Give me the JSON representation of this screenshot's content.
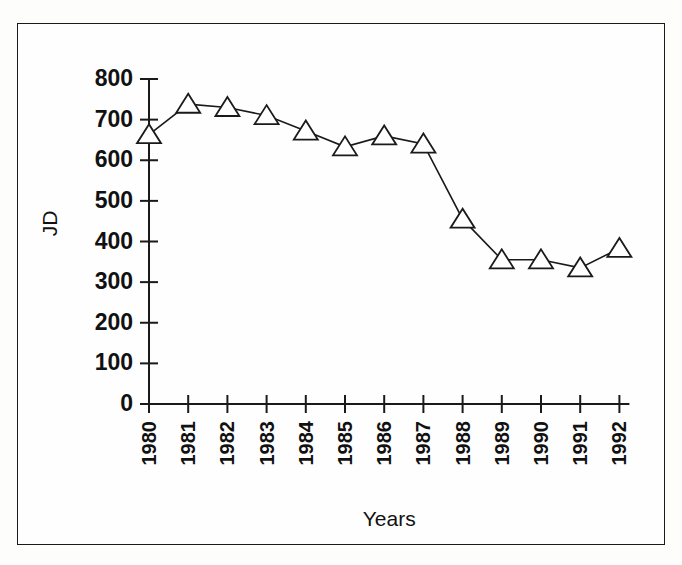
{
  "figure": {
    "frame_color": "#1a1a1a",
    "background_color": "#fefefe",
    "line_color": "#1a1a1a",
    "marker_fill": "#ffffff"
  },
  "chart_data": {
    "type": "line",
    "title": "",
    "subtitle": "",
    "xlabel": "Years",
    "ylabel": "JD",
    "categories": [
      "1980",
      "1981",
      "1982",
      "1983",
      "1984",
      "1985",
      "1986",
      "1987",
      "1988",
      "1989",
      "1990",
      "1991",
      "1992"
    ],
    "values": [
      663,
      738,
      730,
      710,
      672,
      633,
      660,
      640,
      455,
      355,
      355,
      335,
      383
    ],
    "series": [
      {
        "name": "JD",
        "marker": "triangle-open",
        "values": [
          663,
          738,
          730,
          710,
          672,
          633,
          660,
          640,
          455,
          355,
          355,
          335,
          383
        ]
      }
    ],
    "ylim": [
      0,
      800
    ],
    "ytick_values": [
      0,
      100,
      200,
      300,
      400,
      500,
      600,
      700,
      800
    ],
    "ytick_labels": [
      "0",
      "100",
      "200",
      "300",
      "400",
      "500",
      "600",
      "700",
      "800"
    ],
    "xtick_labels": [
      "1980",
      "1981",
      "1982",
      "1983",
      "1984",
      "1985",
      "1986",
      "1987",
      "1988",
      "1989",
      "1990",
      "1991",
      "1992"
    ],
    "xtick_rotation": 90,
    "grid": false,
    "legend": false,
    "legend_position": "none"
  }
}
